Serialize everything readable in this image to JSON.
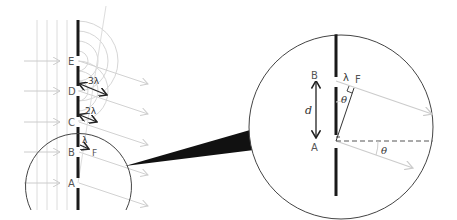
{
  "diagram": {
    "colors": {
      "barrier": "#1a1a1a",
      "wave_lines": "#d6d6d6",
      "rays": "#cccccc",
      "magnifier": "#444444",
      "label": "#555555"
    },
    "left_panel": {
      "slit_labels": [
        "E",
        "D",
        "C",
        "B",
        "A"
      ],
      "path_labels": {
        "three_lambda": "3λ",
        "two_lambda": "2λ",
        "lambda": "λ",
        "point_f": "F"
      }
    },
    "zoom_panel": {
      "point_b": "B",
      "point_a": "A",
      "point_f": "F",
      "separation": "d",
      "wavelength": "λ",
      "angle_inner": "θ",
      "angle_outer": "θ"
    }
  }
}
